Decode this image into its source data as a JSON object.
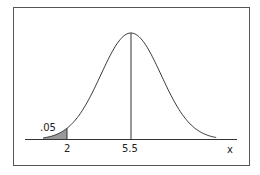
{
  "chart_data": {
    "type": "area",
    "title": "",
    "xlabel": "x",
    "ylabel": "",
    "mean": 5.5,
    "tick_labels": [
      "2",
      "5.5"
    ],
    "shaded_region": {
      "from": "-inf",
      "to": 2,
      "area_label": ".05"
    },
    "grid": false,
    "legend": null
  },
  "labels": {
    "tail_area": ".05",
    "critical_value": "2",
    "mean": "5.5",
    "axis": "x"
  },
  "colors": {
    "curve": "#333333",
    "shade": "#9a9a9a",
    "frame": "#555555"
  }
}
